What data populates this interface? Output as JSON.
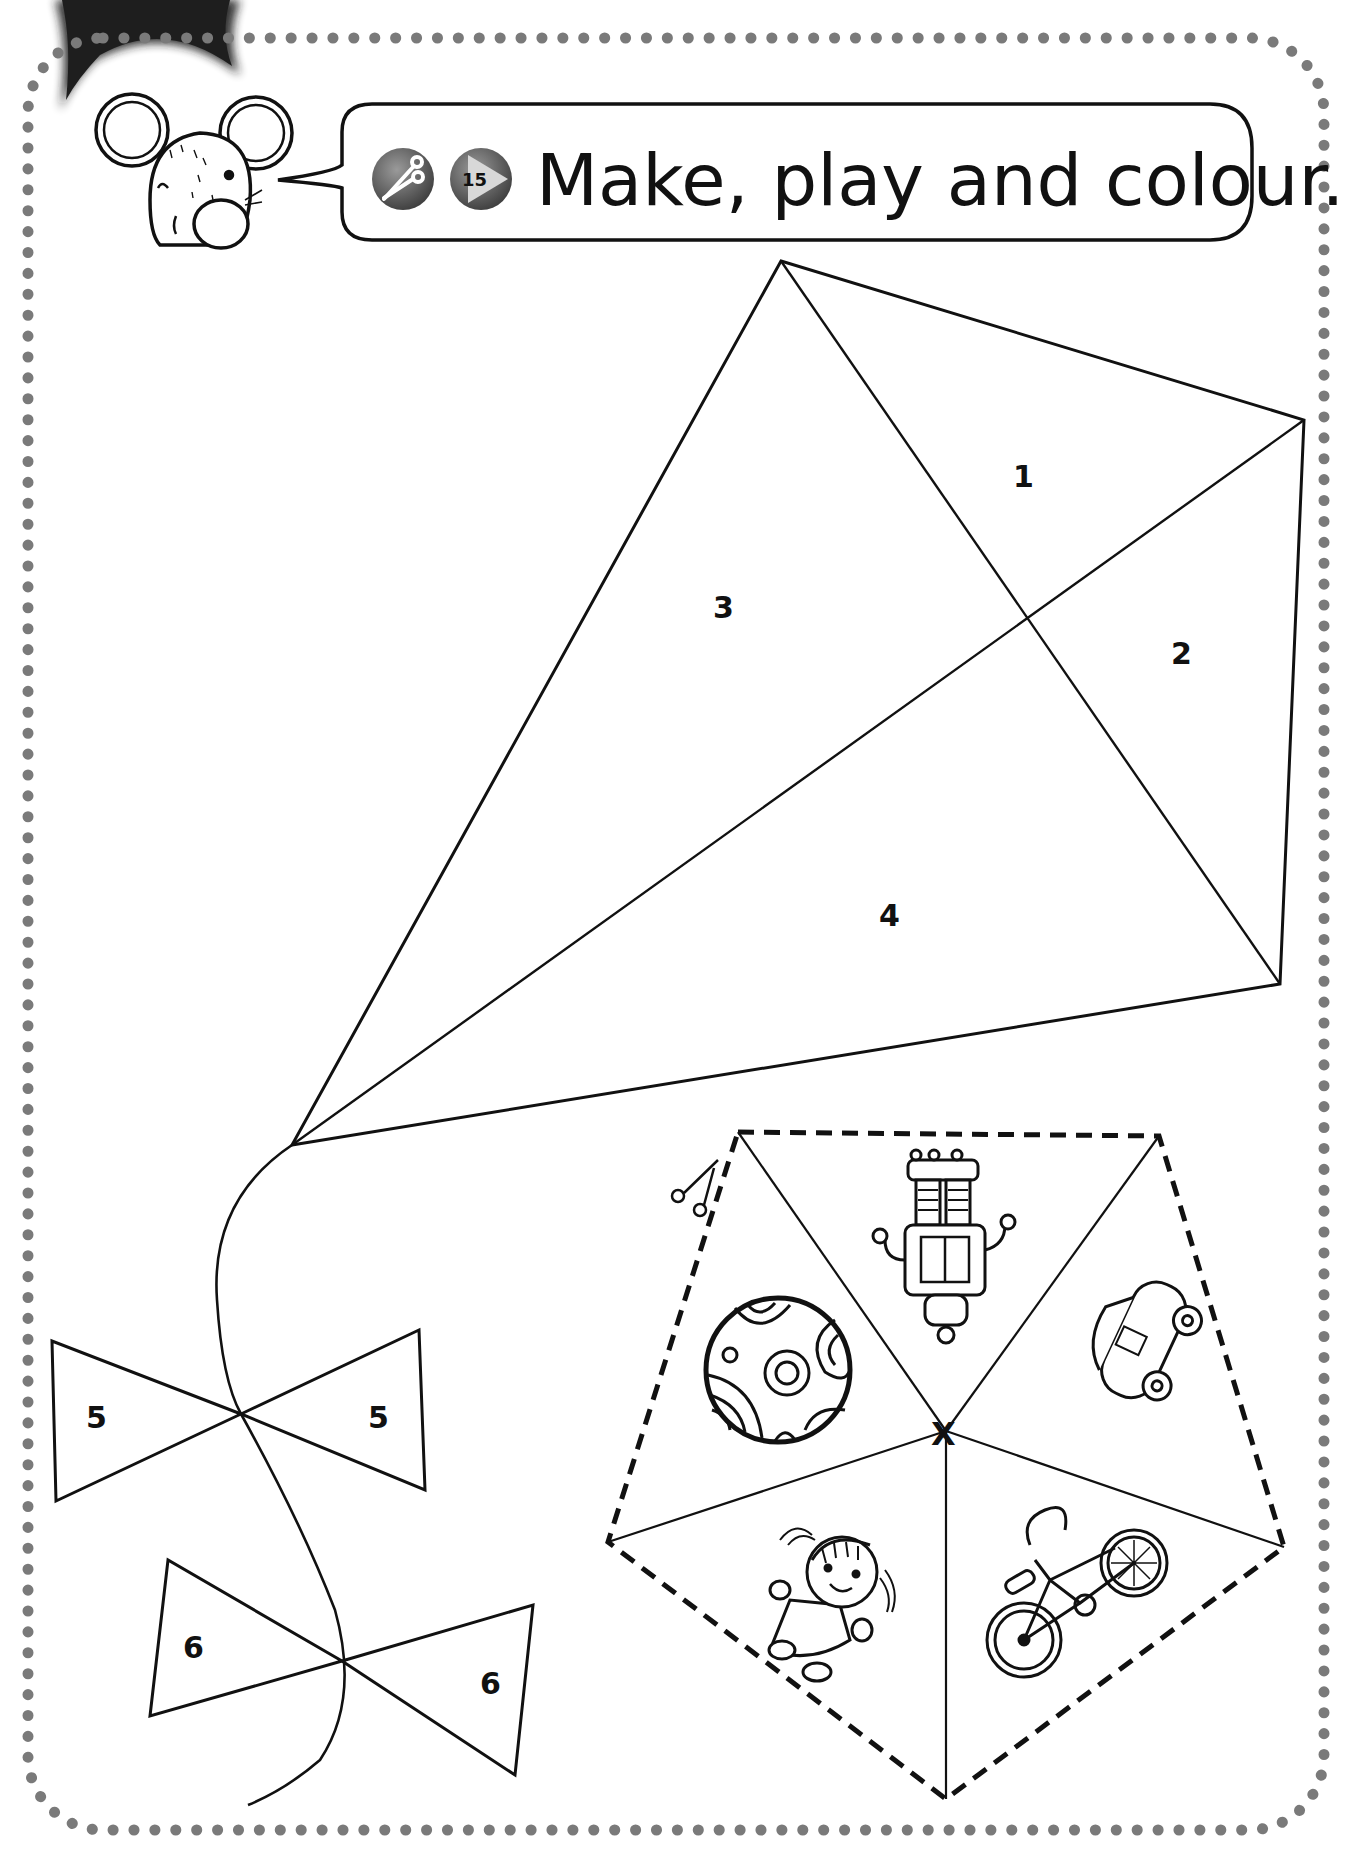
{
  "header": {
    "instruction": "Make, play and colour.",
    "track_number": "15",
    "icons": [
      "scissors-icon",
      "audio-play-icon"
    ]
  },
  "kite": {
    "sections": [
      {
        "label": "1"
      },
      {
        "label": "2"
      },
      {
        "label": "3"
      },
      {
        "label": "4"
      }
    ],
    "bows": [
      {
        "left_label": "5",
        "right_label": "5"
      },
      {
        "left_label": "6",
        "right_label": "6"
      }
    ]
  },
  "spinner": {
    "center_mark": "X",
    "segments": [
      {
        "picture": "robot"
      },
      {
        "picture": "car"
      },
      {
        "picture": "bike"
      },
      {
        "picture": "doll"
      },
      {
        "picture": "ball"
      }
    ],
    "cut_icon": "scissors-icon"
  },
  "colors": {
    "border_dots": "#7a7a7a",
    "line": "#111111",
    "icon_fill": "#5a5a5a",
    "corner_tab": "#1e1e1e"
  }
}
